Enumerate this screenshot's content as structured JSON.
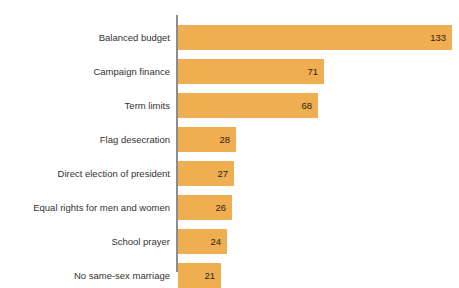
{
  "chart_data": {
    "type": "bar",
    "orientation": "horizontal",
    "title": "",
    "xlabel": "",
    "ylabel": "",
    "grid": false,
    "legend": null,
    "xlim": [
      0,
      133
    ],
    "categories": [
      "Balanced budget",
      "Campaign finance",
      "Term limits",
      "Flag desecration",
      "Direct election of president",
      "Equal rights for men and women",
      "School prayer",
      "No same-sex marriage"
    ],
    "values": [
      133,
      71,
      68,
      28,
      27,
      26,
      24,
      21
    ],
    "value_labels": [
      "133",
      "71",
      "68",
      "28",
      "27",
      "26",
      "24",
      "21"
    ],
    "colors": {
      "bar": "#efae52",
      "axis": "#8d8d8d",
      "label_text": "#333333",
      "value_text": "#2e2112",
      "background": "#ffffff"
    }
  },
  "rows": [
    {
      "label": "Balanced budget",
      "value": 133,
      "value_label": "133"
    },
    {
      "label": "Campaign finance",
      "value": 71,
      "value_label": "71"
    },
    {
      "label": "Term limits",
      "value": 68,
      "value_label": "68"
    },
    {
      "label": "Flag desecration",
      "value": 28,
      "value_label": "28"
    },
    {
      "label": "Direct election of president",
      "value": 27,
      "value_label": "27"
    },
    {
      "label": "Equal rights for men and women",
      "value": 26,
      "value_label": "26"
    },
    {
      "label": "School prayer",
      "value": 24,
      "value_label": "24"
    },
    {
      "label": "No same-sex marriage",
      "value": 21,
      "value_label": "21"
    }
  ]
}
